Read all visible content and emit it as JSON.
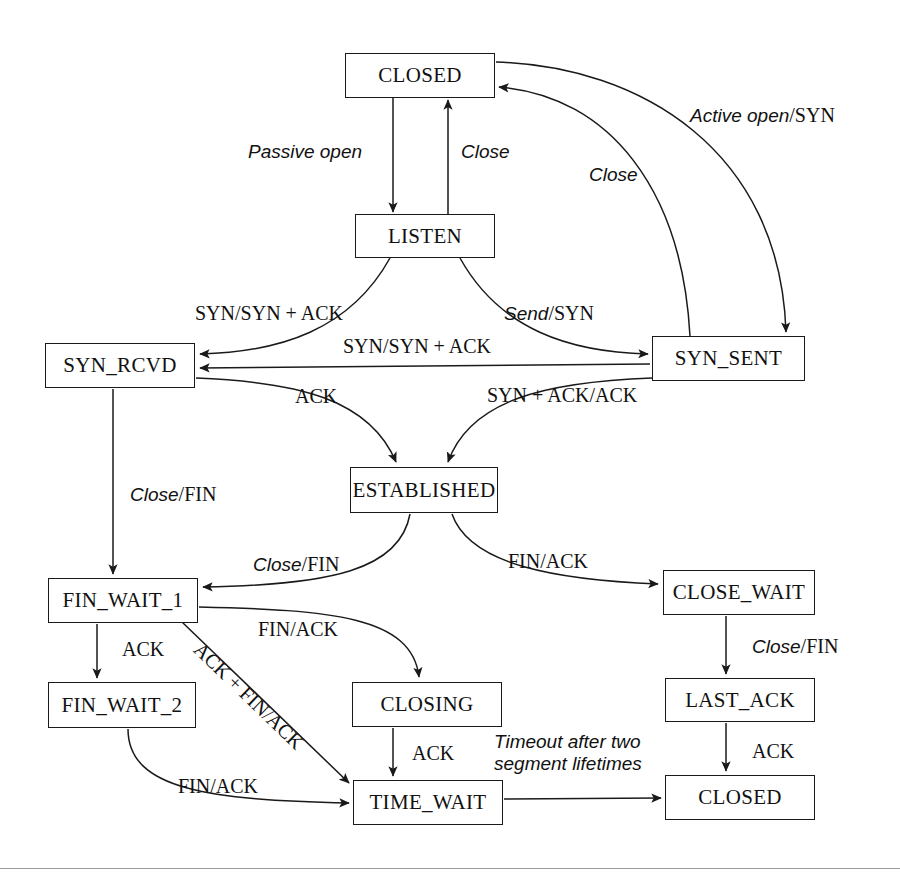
{
  "diagram": {
    "type": "state-machine",
    "stroke_color": "#1a1a1a",
    "background_color": "#ffffff"
  },
  "states": [
    {
      "id": "closed-top",
      "label": "CLOSED",
      "x": 345,
      "y": 53,
      "w": 150,
      "h": 45
    },
    {
      "id": "listen",
      "label": "LISTEN",
      "x": 355,
      "y": 214,
      "w": 140,
      "h": 44
    },
    {
      "id": "syn-rcvd",
      "label": "SYN_RCVD",
      "x": 45,
      "y": 343,
      "w": 150,
      "h": 45
    },
    {
      "id": "syn-sent",
      "label": "SYN_SENT",
      "x": 652,
      "y": 336,
      "w": 153,
      "h": 45
    },
    {
      "id": "established",
      "label": "ESTABLISHED",
      "x": 350,
      "y": 467,
      "w": 148,
      "h": 46
    },
    {
      "id": "fin-wait-1",
      "label": "FIN_WAIT_1",
      "x": 48,
      "y": 578,
      "w": 150,
      "h": 45
    },
    {
      "id": "close-wait",
      "label": "CLOSE_WAIT",
      "x": 663,
      "y": 570,
      "w": 152,
      "h": 45
    },
    {
      "id": "fin-wait-2",
      "label": "FIN_WAIT_2",
      "x": 48,
      "y": 682,
      "w": 148,
      "h": 46
    },
    {
      "id": "closing",
      "label": "CLOSING",
      "x": 352,
      "y": 682,
      "w": 150,
      "h": 45
    },
    {
      "id": "last-ack",
      "label": "LAST_ACK",
      "x": 665,
      "y": 678,
      "w": 150,
      "h": 44
    },
    {
      "id": "time-wait",
      "label": "TIME_WAIT",
      "x": 353,
      "y": 780,
      "w": 150,
      "h": 45
    },
    {
      "id": "closed-bottom",
      "label": "CLOSED",
      "x": 665,
      "y": 775,
      "w": 150,
      "h": 45
    }
  ],
  "transitions": [
    {
      "id": "passive-open",
      "event": "Passive open",
      "action": "",
      "from": "closed-top",
      "to": "listen"
    },
    {
      "id": "close-listen",
      "event": "Close",
      "action": "",
      "from": "listen",
      "to": "closed-top"
    },
    {
      "id": "active-open",
      "event": "Active open",
      "action": "SYN",
      "from": "closed-top",
      "to": "syn-sent"
    },
    {
      "id": "close-syn-sent",
      "event": "Close",
      "action": "",
      "from": "syn-sent",
      "to": "closed-top"
    },
    {
      "id": "send-syn",
      "event": "Send",
      "action": "SYN",
      "from": "listen",
      "to": "syn-sent"
    },
    {
      "id": "syn-listen",
      "event": "SYN",
      "action": "SYN + ACK",
      "from": "listen",
      "to": "syn-rcvd"
    },
    {
      "id": "syn-syn-sent",
      "event": "SYN",
      "action": "SYN + ACK",
      "from": "syn-sent",
      "to": "syn-rcvd"
    },
    {
      "id": "ack-established",
      "event": "ACK",
      "action": "",
      "from": "syn-rcvd",
      "to": "established"
    },
    {
      "id": "syn-ack-ack",
      "event": "SYN + ACK",
      "action": "ACK",
      "from": "syn-sent",
      "to": "established"
    },
    {
      "id": "close-fin-rcvd",
      "event": "Close",
      "action": "FIN",
      "from": "syn-rcvd",
      "to": "fin-wait-1"
    },
    {
      "id": "close-fin-estab",
      "event": "Close",
      "action": "FIN",
      "from": "established",
      "to": "fin-wait-1"
    },
    {
      "id": "fin-ack-estab",
      "event": "FIN",
      "action": "ACK",
      "from": "established",
      "to": "close-wait"
    },
    {
      "id": "ack-fw2",
      "event": "ACK",
      "action": "",
      "from": "fin-wait-1",
      "to": "fin-wait-2"
    },
    {
      "id": "fin-ack-closing",
      "event": "FIN",
      "action": "ACK",
      "from": "fin-wait-1",
      "to": "closing"
    },
    {
      "id": "ack-fin-ack",
      "event": "ACK + FIN",
      "action": "ACK",
      "from": "fin-wait-1",
      "to": "time-wait"
    },
    {
      "id": "fin-ack-tw",
      "event": "FIN",
      "action": "ACK",
      "from": "fin-wait-2",
      "to": "time-wait"
    },
    {
      "id": "ack-closing-tw",
      "event": "ACK",
      "action": "",
      "from": "closing",
      "to": "time-wait"
    },
    {
      "id": "close-fin-cw",
      "event": "Close",
      "action": "FIN",
      "from": "close-wait",
      "to": "last-ack"
    },
    {
      "id": "ack-last",
      "event": "ACK",
      "action": "",
      "from": "last-ack",
      "to": "closed-bottom"
    },
    {
      "id": "timeout",
      "event": "Timeout after two segment lifetimes",
      "action": "",
      "from": "time-wait",
      "to": "closed-bottom"
    }
  ],
  "edge_labels": [
    {
      "id": "passive-open-label",
      "italic": "Passive open",
      "roman": "",
      "x": 248,
      "y": 140,
      "style": "ital"
    },
    {
      "id": "close-listen-label",
      "italic": "Close",
      "roman": "",
      "x": 461,
      "y": 140,
      "style": "ital"
    },
    {
      "id": "active-open-label",
      "italic": "Active open",
      "roman": "/SYN",
      "x": 690,
      "y": 104,
      "style": "ital"
    },
    {
      "id": "close-syn-sent-label",
      "italic": "Close",
      "roman": "",
      "x": 589,
      "y": 163,
      "style": "ital"
    },
    {
      "id": "syn-listen-label",
      "italic": "",
      "roman": "SYN/SYN + ACK",
      "x": 195,
      "y": 302,
      "style": "rom"
    },
    {
      "id": "send-syn-label",
      "italic": "Send",
      "roman": "/SYN",
      "x": 504,
      "y": 302,
      "style": "ital"
    },
    {
      "id": "syn-syn-sent-label",
      "italic": "",
      "roman": "SYN/SYN + ACK",
      "x": 343,
      "y": 335,
      "style": "rom"
    },
    {
      "id": "ack-established-label",
      "italic": "",
      "roman": "ACK",
      "x": 295,
      "y": 385,
      "style": "rom"
    },
    {
      "id": "syn-ack-ack-label",
      "italic": "",
      "roman": "SYN + ACK/ACK",
      "x": 487,
      "y": 384,
      "style": "rom"
    },
    {
      "id": "close-fin-rcvd-label",
      "italic": "Close",
      "roman": "/FIN",
      "x": 130,
      "y": 483,
      "style": "ital"
    },
    {
      "id": "close-fin-estab-label",
      "italic": "Close",
      "roman": "/FIN",
      "x": 253,
      "y": 553,
      "style": "ital"
    },
    {
      "id": "fin-ack-estab-label",
      "italic": "",
      "roman": "FIN/ACK",
      "x": 508,
      "y": 550,
      "style": "rom"
    },
    {
      "id": "fin-ack-closing-label",
      "italic": "",
      "roman": "FIN/ACK",
      "x": 258,
      "y": 618,
      "style": "rom"
    },
    {
      "id": "ack-fw2-label",
      "italic": "",
      "roman": "ACK",
      "x": 122,
      "y": 638,
      "style": "rom"
    },
    {
      "id": "close-fin-cw-label",
      "italic": "Close",
      "roman": "/FIN",
      "x": 752,
      "y": 635,
      "style": "ital"
    },
    {
      "id": "ack-last-label",
      "italic": "",
      "roman": "ACK",
      "x": 752,
      "y": 740,
      "style": "rom"
    },
    {
      "id": "ack-closing-tw-label",
      "italic": "",
      "roman": "ACK",
      "x": 412,
      "y": 742,
      "style": "rom"
    },
    {
      "id": "fin-ack-tw-label",
      "italic": "",
      "roman": "FIN/ACK",
      "x": 178,
      "y": 775,
      "style": "rom"
    },
    {
      "id": "ack-fin-ack-label",
      "italic": "",
      "roman": "ACK + FIN/ACK",
      "x": 205,
      "y": 638,
      "style": "diag"
    }
  ],
  "timeout_label": {
    "id": "timeout-label",
    "line1": "Timeout after two",
    "line2": "segment lifetimes",
    "x": 494,
    "y": 731
  }
}
